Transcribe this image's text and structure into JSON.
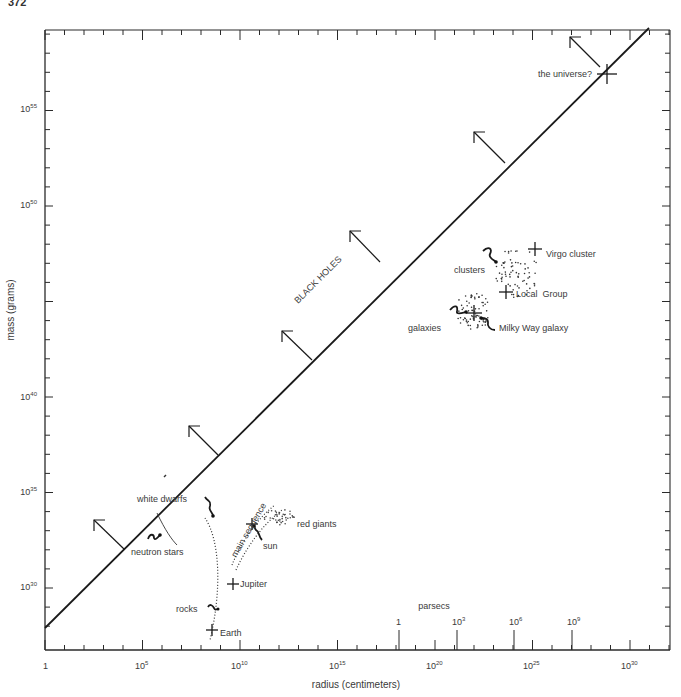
{
  "page": {
    "number": "372"
  },
  "chart_data": {
    "type": "scatter",
    "title": "",
    "xlabel": "radius (centimeters)",
    "ylabel": "mass (grams)",
    "x_scale": "log10",
    "y_scale": "log10",
    "xlim_log10": [
      0,
      33
    ],
    "ylim_log10": [
      28,
      60
    ],
    "x_ticks": [
      {
        "exp": 0,
        "label": "1"
      },
      {
        "exp": 5,
        "label": "10",
        "sup": "5"
      },
      {
        "exp": 10,
        "label": "10",
        "sup": "10"
      },
      {
        "exp": 15,
        "label": "10",
        "sup": "15"
      },
      {
        "exp": 20,
        "label": "10",
        "sup": "20"
      },
      {
        "exp": 25,
        "label": "10",
        "sup": "25"
      },
      {
        "exp": 30,
        "label": "10",
        "sup": "30"
      }
    ],
    "y_ticks": [
      {
        "exp": 30,
        "label": "10",
        "sup": "30"
      },
      {
        "exp": 35,
        "label": "10",
        "sup": "35"
      },
      {
        "exp": 40,
        "label": "10",
        "sup": "40"
      },
      {
        "exp": 50,
        "label": "10",
        "sup": "50"
      },
      {
        "exp": 55,
        "label": "10",
        "sup": "55"
      }
    ],
    "secondary_x_axis": {
      "label": "parsecs",
      "ticks": [
        {
          "label": "1",
          "sup": "",
          "cm_exp": 18.5
        },
        {
          "label": "10",
          "sup": "3",
          "cm_exp": 21.5
        },
        {
          "label": "10",
          "sup": "6",
          "cm_exp": 24.5
        },
        {
          "label": "10",
          "sup": "9",
          "cm_exp": 27.5
        }
      ]
    },
    "black_hole_line": {
      "label": "BLACK HOLES",
      "from_log10": [
        0,
        28
      ],
      "to_log10": [
        31,
        59.3
      ],
      "arrows_at_x_log10": [
        4,
        7.5,
        13.8,
        17.3,
        23.5,
        28.5
      ]
    },
    "points": [
      {
        "name": "the universe?",
        "x_log10": 29.2,
        "y_log10": 56
      },
      {
        "name": "Virgo cluster",
        "x_log10": 25.3,
        "y_log10": 48.2
      },
      {
        "name": "Local Group",
        "x_log10": 24.7,
        "y_log10": 46.3
      },
      {
        "name": "Milky Way galaxy",
        "x_log10": 22.3,
        "y_log10": 45.3
      },
      {
        "name": "sun",
        "x_log10": 10.8,
        "y_log10": 33.3
      },
      {
        "name": "Jupiter",
        "x_log10": 9.8,
        "y_log10": 30.3
      },
      {
        "name": "Earth",
        "x_log10": 8.8,
        "y_log10": 27.8
      }
    ],
    "regions": [
      {
        "name": "clusters"
      },
      {
        "name": "galaxies"
      },
      {
        "name": "white dwarfs"
      },
      {
        "name": "neutron stars"
      },
      {
        "name": "main sequence"
      },
      {
        "name": "red giants"
      },
      {
        "name": "rocks"
      }
    ],
    "grid": false,
    "legend": "none"
  },
  "labels": {
    "xlabel": "radius (centimeters)",
    "ylabel": "mass (grams)",
    "black_holes": "BLACK HOLES",
    "parsecs": "parsecs",
    "universe": "the universe?",
    "virgo": "Virgo cluster",
    "clusters": "clusters",
    "local_group": "Local  Group",
    "galaxies": "galaxies",
    "milky_way": "Milky Way galaxy",
    "white_dwarfs": "white dwarfs",
    "neutron_stars": "neutron stars",
    "main_sequence": "main sequence",
    "red_giants": "red giants",
    "sun": "sun",
    "jupiter": "Jupiter",
    "rocks": "rocks",
    "earth": "Earth",
    "x1": "1",
    "x5": "5",
    "x10": "10",
    "x15": "15",
    "x20": "20",
    "x25": "25",
    "x30": "30",
    "y30": "30",
    "y35": "35",
    "y40": "40",
    "y50": "50",
    "y55": "55",
    "base": "10",
    "pc1": "1",
    "pc3": "3",
    "pc6": "6",
    "pc9": "9"
  }
}
